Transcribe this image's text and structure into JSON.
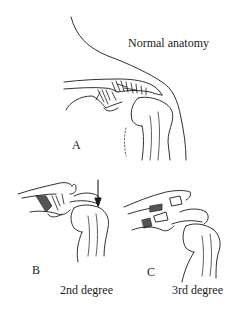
{
  "figure": {
    "panels": [
      {
        "id": "A",
        "letter": "A",
        "caption": "Normal anatomy"
      },
      {
        "id": "B",
        "letter": "B",
        "caption": "2nd degree"
      },
      {
        "id": "C",
        "letter": "C",
        "caption": "3rd degree"
      }
    ],
    "colors": {
      "line": "#1a1a1a",
      "background": "#ffffff",
      "ligament_fill": "#555555"
    },
    "icons": {
      "arrow": "down-arrow"
    }
  }
}
